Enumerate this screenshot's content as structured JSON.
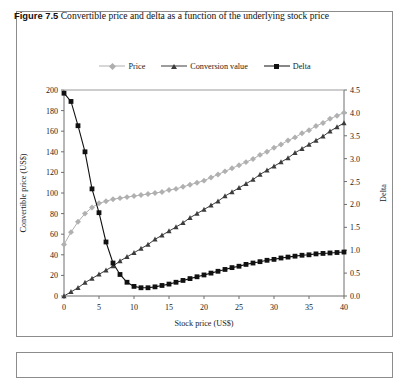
{
  "figure": {
    "number": "Figure 7.5",
    "caption": "Convertible price and delta as a function of the underlying stock price"
  },
  "chart_data": {
    "type": "line",
    "title": "",
    "xlabel": "Stock price (US$)",
    "ylabel": "Convertible price (US$)",
    "y2label": "Delta",
    "xlim": [
      0,
      40
    ],
    "ylim": [
      0,
      200
    ],
    "y2lim": [
      0.0,
      4.5
    ],
    "xticks": [
      0,
      5,
      10,
      15,
      20,
      25,
      30,
      35,
      40
    ],
    "yticks": [
      0,
      20,
      40,
      60,
      80,
      100,
      120,
      140,
      160,
      180,
      200
    ],
    "y2ticks": [
      "0.0",
      "0.5",
      "1.0",
      "1.5",
      "2.0",
      "2.5",
      "3.0",
      "3.5",
      "4.0",
      "4.5"
    ],
    "grid": false,
    "legend_position": "top-center",
    "x": [
      0,
      1,
      2,
      3,
      4,
      5,
      6,
      7,
      8,
      9,
      10,
      11,
      12,
      13,
      14,
      15,
      16,
      17,
      18,
      19,
      20,
      21,
      22,
      23,
      24,
      25,
      26,
      27,
      28,
      29,
      30,
      31,
      32,
      33,
      34,
      35,
      36,
      37,
      38,
      39,
      40
    ],
    "series": [
      {
        "name": "Price",
        "marker": "diamond",
        "color": "#b0b0b0",
        "axis": "left",
        "values": [
          50,
          62,
          72,
          80,
          86,
          90,
          92,
          94,
          95,
          96,
          97,
          98,
          99,
          100,
          101,
          103,
          104,
          106,
          108,
          110,
          112,
          115,
          118,
          121,
          124,
          127,
          130,
          133,
          137,
          140,
          144,
          147,
          151,
          154,
          158,
          161,
          165,
          168,
          172,
          175,
          178
        ]
      },
      {
        "name": "Conversion value",
        "marker": "triangle",
        "color": "#3c3c3c",
        "axis": "left",
        "values": [
          0,
          4,
          8,
          13,
          17,
          21,
          25,
          29,
          34,
          38,
          42,
          46,
          50,
          55,
          59,
          63,
          67,
          71,
          76,
          80,
          84,
          88,
          92,
          97,
          101,
          105,
          109,
          113,
          118,
          122,
          126,
          130,
          134,
          139,
          143,
          147,
          151,
          155,
          160,
          164,
          168
        ]
      },
      {
        "name": "Delta",
        "marker": "square",
        "color": "#111111",
        "axis": "right",
        "values": [
          4.43,
          4.25,
          3.72,
          3.15,
          2.34,
          1.82,
          1.18,
          0.72,
          0.47,
          0.3,
          0.21,
          0.18,
          0.18,
          0.2,
          0.23,
          0.26,
          0.3,
          0.34,
          0.38,
          0.42,
          0.46,
          0.5,
          0.54,
          0.58,
          0.62,
          0.65,
          0.69,
          0.72,
          0.75,
          0.78,
          0.8,
          0.83,
          0.85,
          0.87,
          0.89,
          0.9,
          0.92,
          0.93,
          0.94,
          0.95,
          0.96
        ]
      }
    ]
  }
}
